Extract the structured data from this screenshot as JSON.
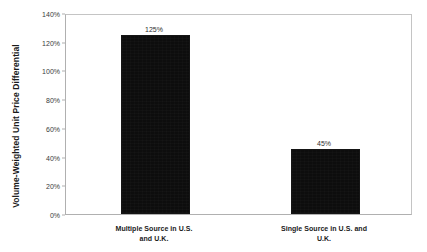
{
  "chart_data": {
    "type": "bar",
    "title": "",
    "subtitle": "",
    "xlabel": "",
    "ylabel": "Volume-Weighted Unit Price Differential",
    "ylim": [
      0,
      140
    ],
    "y_tick_labels": [
      "0%",
      "20%",
      "40%",
      "60%",
      "80%",
      "100%",
      "120%",
      "140%"
    ],
    "y_tick_values": [
      0,
      20,
      40,
      60,
      80,
      100,
      120,
      140
    ],
    "grid": false,
    "legend": false,
    "orientation": "vertical",
    "bar_color": "#0d0d0d",
    "categories": [
      "Multiple Source in U.S. and U.K.",
      "Single Source in U.S. and U.K."
    ],
    "category_lines": [
      [
        "Multiple Source in U.S.",
        "and U.K."
      ],
      [
        "Single Source in U.S. and",
        "U.K."
      ]
    ],
    "values": [
      125,
      45
    ],
    "data_labels": [
      "125%",
      "45%"
    ]
  }
}
